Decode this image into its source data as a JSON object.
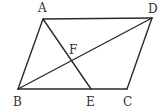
{
  "diagram": {
    "type": "geometry",
    "shape": "parallelogram ABCD",
    "stroke_color": "#2a2a2a",
    "points": {
      "A": {
        "x": 43,
        "y": 19
      },
      "B": {
        "x": 18,
        "y": 89
      },
      "C": {
        "x": 127,
        "y": 89
      },
      "D": {
        "x": 152,
        "y": 18
      },
      "E": {
        "x": 91,
        "y": 89
      },
      "F": {
        "x": 73,
        "y": 58
      }
    },
    "segments": [
      "AB",
      "BC",
      "CD",
      "DA",
      "BD",
      "AE"
    ],
    "labels": {
      "A": "A",
      "B": "B",
      "C": "C",
      "D": "D",
      "E": "E",
      "F": "F"
    }
  }
}
